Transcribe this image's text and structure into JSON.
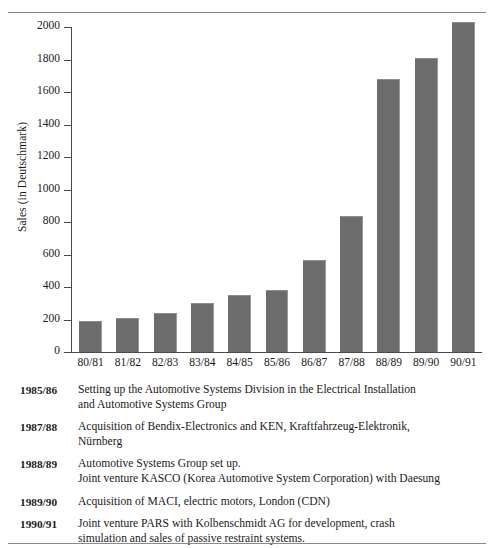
{
  "chart_data": {
    "type": "bar",
    "title": "",
    "xlabel": "",
    "ylabel": "Sales (in Deutschmark)",
    "categories": [
      "80/81",
      "81/82",
      "82/83",
      "83/84",
      "84/85",
      "85/86",
      "86/87",
      "87/88",
      "88/89",
      "89/90",
      "90/91"
    ],
    "values": [
      190,
      210,
      240,
      300,
      350,
      380,
      565,
      840,
      1680,
      1810,
      2030
    ],
    "ylim": [
      0,
      2000
    ],
    "yticks": [
      0,
      200,
      400,
      600,
      800,
      1000,
      1200,
      1400,
      1600,
      1800,
      2000
    ],
    "ytick_labels": [
      "0",
      "200",
      "400",
      "600",
      "800",
      "1000",
      "1200",
      "1400",
      "1600",
      "1800",
      "2000"
    ],
    "grid": false,
    "legend": false,
    "bar_color": "#6c6c6c"
  },
  "notes": [
    {
      "year": "1985/86",
      "lines": [
        "Setting up the Automotive Systems Division in the Electrical Installation",
        "and Automotive Systems Group"
      ]
    },
    {
      "year": "1987/88",
      "lines": [
        "Acquisition of Bendix-Electronics and KEN, Kraftfahrzeug-Elektronik,",
        "Nürnberg"
      ]
    },
    {
      "year": "1988/89",
      "lines": [
        "Automotive Systems Group set up.",
        "Joint venture KASCO (Korea Automotive System Corporation) with Daesung"
      ]
    },
    {
      "year": "1989/90",
      "lines": [
        "Acquisition of MACI, electric motors, London (CDN)"
      ]
    },
    {
      "year": "1990/91",
      "lines": [
        "Joint venture PARS with Kolbenschmidt AG for development, crash",
        "simulation and sales of passive restraint systems."
      ]
    }
  ]
}
